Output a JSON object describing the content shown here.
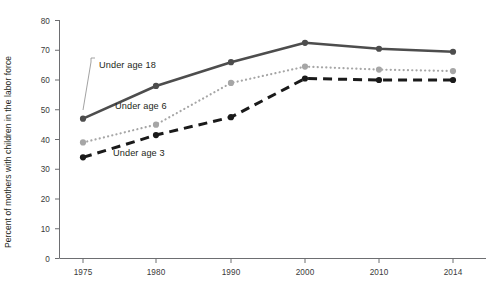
{
  "chart_data": {
    "type": "line",
    "title": "",
    "subtitle": "",
    "xlabel": "",
    "ylabel": "Percent of mothers with children in the labor force",
    "categories": [
      "1975",
      "1980",
      "1990",
      "2000",
      "2010",
      "2014"
    ],
    "x": [
      1975,
      1980,
      1990,
      2000,
      2010,
      2014
    ],
    "xlim": [
      1975,
      2014
    ],
    "ylim": [
      0,
      80
    ],
    "ytick_labels": [
      "0",
      "10",
      "20",
      "30",
      "40",
      "50",
      "60",
      "70",
      "80"
    ],
    "yticks": [
      0,
      10,
      20,
      30,
      40,
      50,
      60,
      70,
      80
    ],
    "grid": false,
    "legend_position": "inline-annotations",
    "series": [
      {
        "name": "Under age 18",
        "label": "Under age 18",
        "color": "#4d4d4d",
        "style": "solid",
        "values": [
          47,
          58,
          66,
          72.5,
          70.5,
          69.5
        ]
      },
      {
        "name": "Under age 6",
        "label": "Under age 6",
        "color": "#a6a6a6",
        "style": "dotted",
        "values": [
          39,
          45,
          59,
          64.5,
          63.5,
          63
        ]
      },
      {
        "name": "Under age 3",
        "label": "Under age 3",
        "color": "#1a1a1a",
        "style": "dashed",
        "values": [
          34,
          41.5,
          47.5,
          60.5,
          60,
          60
        ]
      }
    ],
    "annotations": [
      {
        "text": "Under age 18",
        "series": "Under age 18"
      },
      {
        "text": "Under age 6",
        "series": "Under age 6"
      },
      {
        "text": "Under age 3",
        "series": "Under age 3"
      }
    ]
  },
  "axis": {
    "y_title": "Percent of mothers with children in the labor force"
  },
  "colors": {
    "axis": "#6d6e71",
    "text": "#231f20",
    "series_18": "#4d4d4d",
    "series_6": "#a6a6a6",
    "series_3": "#1a1a1a"
  }
}
